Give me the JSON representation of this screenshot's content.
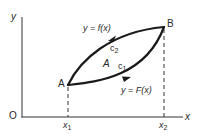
{
  "diagram": {
    "axes": {
      "y_label": "y",
      "x_label": "x",
      "origin_label": "O"
    },
    "points": {
      "A": "A",
      "B": "B"
    },
    "ticks": {
      "x1_base": "x",
      "x1_sub": "1",
      "x2_base": "x",
      "x2_sub": "2"
    },
    "curves": {
      "upper_label": "y = f(x)",
      "lower_label": "y = F(x)",
      "upper_name_base": "c",
      "upper_name_sub": "2",
      "lower_name_base": "c",
      "lower_name_sub": "1"
    },
    "region_label": "A",
    "colors": {
      "stroke": "#1a1a1a",
      "text": "#2a2a2a",
      "background": "#ffffff"
    }
  }
}
